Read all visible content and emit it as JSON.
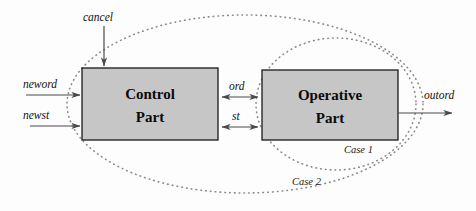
{
  "diagram": {
    "background_color": "#fdfdfd",
    "blocks": [
      {
        "id": "control-part",
        "line1": "Control",
        "line2": "Part",
        "fill": "#c6c6c6",
        "stroke": "#1a1a1a"
      },
      {
        "id": "operative-part",
        "line1": "Operative",
        "line2": "Part",
        "fill": "#c6c6c6",
        "stroke": "#1a1a1a"
      }
    ],
    "signals": {
      "cancel": "cancel",
      "neword": "neword",
      "newst": "newst",
      "ord": "ord",
      "st": "st",
      "outord": "outord"
    },
    "boundaries": [
      {
        "id": "case-1",
        "label": "Case 1",
        "style": "dotted-ellipse",
        "color": "#8a8a8a"
      },
      {
        "id": "case-2",
        "label": "Case 2",
        "style": "dotted-ellipse",
        "color": "#8a8a8a"
      }
    ],
    "arrow_color": "#4a4a4a"
  }
}
